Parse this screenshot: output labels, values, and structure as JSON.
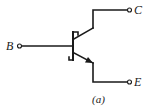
{
  "diagram": {
    "type": "schottky-npn-transistor-symbol",
    "terminals": {
      "base": "B",
      "collector": "C",
      "emitter": "E"
    },
    "caption": "(a)",
    "colors": {
      "ink": "#1a1a1a",
      "background": "#ffffff"
    }
  }
}
